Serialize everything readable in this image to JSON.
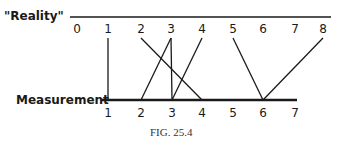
{
  "diagram": {
    "top_axis": {
      "title": "\"Reality\"",
      "labels": [
        "0",
        "1",
        "2",
        "3",
        "4",
        "5",
        "6",
        "7",
        "8"
      ],
      "x": [
        77,
        108,
        141,
        171,
        202,
        233,
        263,
        295,
        323
      ],
      "line": {
        "x1": 70,
        "x2": 331,
        "y": 17
      },
      "label_y": 33,
      "line_top_y": 38
    },
    "bottom_axis": {
      "title": "Measurement",
      "labels": [
        "1",
        "2",
        "3",
        "4",
        "5",
        "6",
        "7"
      ],
      "x": [
        108,
        141,
        172,
        202,
        233,
        263,
        295
      ],
      "line": {
        "x1": 101,
        "x2": 297,
        "y": 100
      },
      "label_y": 117
    },
    "mappings": [
      {
        "reality": "1",
        "measurement": "1"
      },
      {
        "reality": "2",
        "measurement": "4"
      },
      {
        "reality": "3",
        "measurement": "2"
      },
      {
        "reality": "3",
        "measurement": "3"
      },
      {
        "reality": "4",
        "measurement": "3"
      },
      {
        "reality": "5",
        "measurement": "6"
      },
      {
        "reality": "8",
        "measurement": "6"
      }
    ],
    "caption": "FIG. 25.4",
    "color": "#1a1a1a"
  }
}
